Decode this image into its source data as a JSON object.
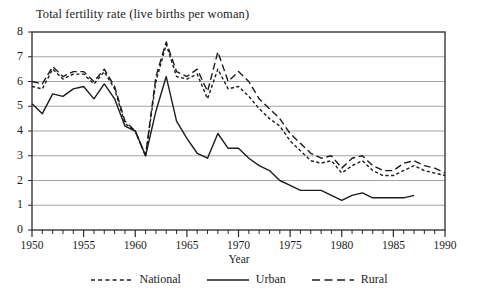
{
  "chart_data": {
    "type": "line",
    "title": "Total fertility rate (live births per woman)",
    "xlabel": "Year",
    "ylabel": "",
    "xlim": [
      1950,
      1990
    ],
    "ylim": [
      0,
      8
    ],
    "grid": true,
    "legend_position": "bottom",
    "x_tick_labels": [
      "1950",
      "1955",
      "1960",
      "1965",
      "1970",
      "1975",
      "1980",
      "1985",
      "1990"
    ],
    "x_tick_values": [
      1950,
      1955,
      1960,
      1965,
      1970,
      1975,
      1980,
      1985,
      1990
    ],
    "x_minor_tick_interval": 1,
    "y_tick_labels": [
      "0",
      "1",
      "2",
      "3",
      "4",
      "5",
      "6",
      "7",
      "8"
    ],
    "y_tick_values": [
      0,
      1,
      2,
      3,
      4,
      5,
      6,
      7,
      8
    ],
    "series": [
      {
        "name": "National",
        "style": "short-dash",
        "color": "#1c1c1c",
        "x": [
          1950,
          1951,
          1952,
          1953,
          1954,
          1955,
          1956,
          1957,
          1958,
          1959,
          1960,
          1961,
          1962,
          1963,
          1964,
          1965,
          1966,
          1967,
          1968,
          1969,
          1970,
          1971,
          1972,
          1973,
          1974,
          1975,
          1976,
          1977,
          1978,
          1979,
          1980,
          1981,
          1982,
          1983,
          1984,
          1985,
          1986,
          1987,
          1988,
          1989,
          1990
        ],
        "values": [
          5.8,
          5.7,
          6.5,
          6.1,
          6.3,
          6.3,
          5.9,
          6.4,
          5.7,
          4.3,
          4.0,
          3.0,
          6.0,
          7.5,
          6.2,
          6.1,
          6.3,
          5.3,
          6.5,
          5.7,
          5.8,
          5.4,
          4.9,
          4.5,
          4.2,
          3.6,
          3.2,
          2.8,
          2.7,
          2.8,
          2.3,
          2.6,
          2.8,
          2.4,
          2.2,
          2.2,
          2.4,
          2.6,
          2.4,
          2.3,
          2.2
        ]
      },
      {
        "name": "Urban",
        "style": "solid",
        "color": "#1c1c1c",
        "x": [
          1950,
          1951,
          1952,
          1953,
          1954,
          1955,
          1956,
          1957,
          1958,
          1959,
          1960,
          1961,
          1962,
          1963,
          1964,
          1965,
          1966,
          1967,
          1968,
          1969,
          1970,
          1971,
          1972,
          1973,
          1974,
          1975,
          1976,
          1977,
          1978,
          1979,
          1980,
          1981,
          1982,
          1983,
          1984,
          1985,
          1986,
          1987
        ],
        "values": [
          5.1,
          4.7,
          5.5,
          5.4,
          5.7,
          5.8,
          5.3,
          5.9,
          5.3,
          4.2,
          4.0,
          3.0,
          4.8,
          6.2,
          4.4,
          3.7,
          3.1,
          2.9,
          3.9,
          3.3,
          3.3,
          2.9,
          2.6,
          2.4,
          2.0,
          1.8,
          1.6,
          1.6,
          1.6,
          1.4,
          1.2,
          1.4,
          1.5,
          1.3,
          1.3,
          1.3,
          1.3,
          1.4
        ]
      },
      {
        "name": "Rural",
        "style": "long-dash",
        "color": "#1c1c1c",
        "x": [
          1950,
          1951,
          1952,
          1953,
          1954,
          1955,
          1956,
          1957,
          1958,
          1959,
          1960,
          1961,
          1962,
          1963,
          1964,
          1965,
          1966,
          1967,
          1968,
          1969,
          1970,
          1971,
          1972,
          1973,
          1974,
          1975,
          1976,
          1977,
          1978,
          1979,
          1980,
          1981,
          1982,
          1983,
          1984,
          1985,
          1986,
          1987,
          1988,
          1989,
          1990
        ],
        "values": [
          6.0,
          5.9,
          6.6,
          6.2,
          6.4,
          6.4,
          6.0,
          6.5,
          5.8,
          4.4,
          4.0,
          3.0,
          6.2,
          7.6,
          6.4,
          6.2,
          6.5,
          5.6,
          7.2,
          6.0,
          6.4,
          6.0,
          5.3,
          4.9,
          4.5,
          3.9,
          3.5,
          3.1,
          2.9,
          3.0,
          2.5,
          2.9,
          3.0,
          2.6,
          2.4,
          2.4,
          2.7,
          2.8,
          2.6,
          2.5,
          2.3
        ]
      }
    ],
    "legend": [
      {
        "label": "National",
        "style": "short-dash"
      },
      {
        "label": "Urban",
        "style": "solid"
      },
      {
        "label": "Rural",
        "style": "long-dash"
      }
    ]
  }
}
